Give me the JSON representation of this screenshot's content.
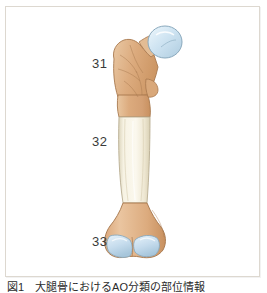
{
  "figure": {
    "caption": "図1　大腿骨におけるAO分類の部位情報",
    "frame_border_color": "#ddd8d0",
    "background_color": "#ffffff"
  },
  "illustration": {
    "name": "femur-anatomical-illustration",
    "subject": "femur",
    "view": "anterior",
    "palette": {
      "cartilage_blue": "#c5dced",
      "cartilage_blue_light": "#e2f0f8",
      "cartilage_outline": "#8aa9bd",
      "metaphysis_tan": "#dcab7e",
      "metaphysis_tan_light": "#eac6a0",
      "metaphysis_outline": "#a8794f",
      "diaphysis_cream": "#f6f1df",
      "diaphysis_cream_shade": "#e8e0c8",
      "diaphysis_outline": "#b9ae92"
    },
    "parts": [
      {
        "name": "femoral-head",
        "tissue": "cartilage"
      },
      {
        "name": "femoral-neck",
        "tissue": "bone"
      },
      {
        "name": "greater-trochanter",
        "tissue": "bone"
      },
      {
        "name": "lesser-trochanter",
        "tissue": "bone"
      },
      {
        "name": "femoral-shaft",
        "tissue": "bone"
      },
      {
        "name": "medial-condyle",
        "tissue": "cartilage"
      },
      {
        "name": "lateral-condyle",
        "tissue": "cartilage"
      }
    ]
  },
  "labels": [
    {
      "id": "31",
      "text": "31",
      "segment": "proximal",
      "anatomy": "proximal femur"
    },
    {
      "id": "32",
      "text": "32",
      "segment": "diaphyseal",
      "anatomy": "femoral shaft"
    },
    {
      "id": "33",
      "text": "33",
      "segment": "distal",
      "anatomy": "distal femur"
    }
  ]
}
